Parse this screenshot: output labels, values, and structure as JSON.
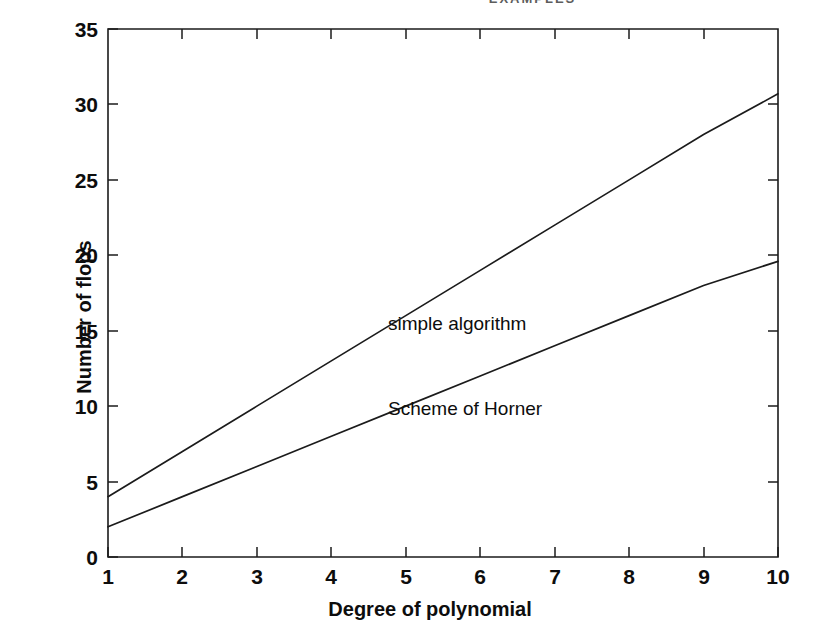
{
  "page": {
    "running_head": "EXAMPLES"
  },
  "chart_data": {
    "type": "line",
    "title": "",
    "xlabel": "Degree of polynomial",
    "ylabel": "Number of flops",
    "xlim": [
      1,
      10
    ],
    "ylim": [
      0,
      35
    ],
    "grid": false,
    "legend_position": "inline-annotation",
    "x": [
      1,
      2,
      3,
      4,
      5,
      6,
      7,
      8,
      9,
      10
    ],
    "xticks": [
      "1",
      "2",
      "3",
      "4",
      "5",
      "6",
      "7",
      "8",
      "9",
      "10"
    ],
    "yticks": [
      "0",
      "5",
      "10",
      "15",
      "20",
      "25",
      "30",
      "35"
    ],
    "series": [
      {
        "name": "simple algorithm",
        "values": [
          4,
          7,
          10,
          13,
          16,
          19,
          22,
          25,
          28,
          30.7
        ],
        "color": "#1b1b1b",
        "label_x": 5,
        "label_y": 16.5
      },
      {
        "name": "Scheme of Horner",
        "values": [
          2,
          4,
          6,
          8,
          10,
          12,
          14,
          16,
          18,
          19.6
        ],
        "color": "#1b1b1b",
        "label_x": 5,
        "label_y": 10.8
      }
    ]
  },
  "axes": {
    "y_title": "Number of flops",
    "x_title": "Degree of polynomial",
    "y_tick_labels": [
      "35",
      "30",
      "25",
      "20",
      "15",
      "10",
      "5",
      "0"
    ],
    "x_tick_labels": [
      "1",
      "2",
      "3",
      "4",
      "5",
      "6",
      "7",
      "8",
      "9",
      "10"
    ]
  },
  "annotations": {
    "simple_algorithm": "simple algorithm",
    "scheme_of_horner": "Scheme of Horner"
  },
  "colors": {
    "ink": "#1b1b1b",
    "paper": "#ffffff"
  }
}
